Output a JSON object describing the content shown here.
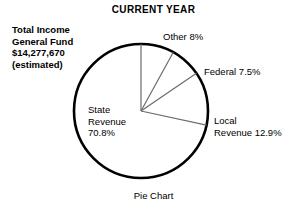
{
  "title": "CURRENT YEAR",
  "caption": "Pie Chart",
  "summary": {
    "line1": "Total Income",
    "line2": "General Fund",
    "line3": "$14,277,670",
    "line4": "(estimated)"
  },
  "labels": {
    "other": "Other 8%",
    "federal": "Federal 7.5%",
    "local_line1": "Local",
    "local_line2": "Revenue 12.9%",
    "state_line1": "State",
    "state_line2": "Revenue",
    "state_line3": "70.8%"
  },
  "colors": {
    "outline": "#000000",
    "divider": "#6b6b6b",
    "fill": "#ffffff",
    "text": "#000000",
    "background": "#ffffff"
  },
  "chart_data": {
    "type": "pie",
    "title": "CURRENT YEAR",
    "subtitle": "Total Income General Fund $14,277,670 (estimated)",
    "caption": "Pie Chart",
    "unit": "percent",
    "total_value": "$14,277,670",
    "start_angle_deg": 0,
    "direction": "clockwise",
    "legend": "labels-outside-slices",
    "grid": false,
    "categories": [
      "Other",
      "Federal",
      "Local Revenue",
      "State Revenue"
    ],
    "values": [
      8,
      7.5,
      12.9,
      70.8
    ],
    "labels": [
      "Other 8%",
      "Federal 7.5%",
      "Local Revenue 12.9%",
      "State Revenue 70.8%"
    ],
    "slices": [
      {
        "name": "Other",
        "value": 8,
        "label": "Other 8%",
        "start_deg": 0,
        "end_deg": 28.8
      },
      {
        "name": "Federal",
        "value": 7.5,
        "label": "Federal 7.5%",
        "start_deg": 28.8,
        "end_deg": 55.8
      },
      {
        "name": "Local Revenue",
        "value": 12.9,
        "label": "Local Revenue 12.9%",
        "start_deg": 55.8,
        "end_deg": 102.24
      },
      {
        "name": "State Revenue",
        "value": 70.8,
        "label": "State Revenue 70.8%",
        "start_deg": 102.24,
        "end_deg": 360
      }
    ]
  }
}
